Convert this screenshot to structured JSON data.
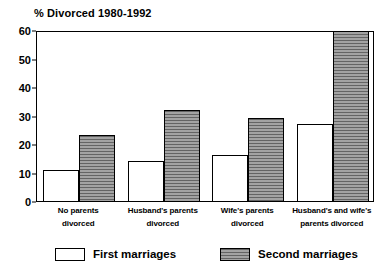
{
  "chart_data": {
    "type": "bar",
    "title": "% Divorced 1980-1992",
    "xlabel": "",
    "ylabel": "",
    "ylim": [
      0,
      60
    ],
    "yticks": [
      0,
      10,
      20,
      30,
      40,
      50,
      60
    ],
    "ytick_labels": [
      "0",
      "10",
      "20",
      "30",
      "40",
      "50",
      "60"
    ],
    "grid": false,
    "legend_position": "bottom",
    "categories": [
      "No parents divorced",
      "Husband's parents divorced",
      "Wife's parents divorced",
      "Husband's and wife's parents divorced"
    ],
    "category_lines": [
      [
        "No parents",
        "divorced"
      ],
      [
        "Husband's parents",
        "divorced"
      ],
      [
        "Wife's parents",
        "divorced"
      ],
      [
        "Husband's and wife's",
        "parents divorced"
      ]
    ],
    "series": [
      {
        "name": "First marriages",
        "values": [
          11,
          14,
          16,
          27
        ],
        "fill": "#ffffff",
        "pattern": "solid",
        "edge": "#000000"
      },
      {
        "name": "Second marriages",
        "values": [
          23,
          32,
          29,
          60
        ],
        "fill": "#8f8f8f",
        "pattern": "horizontal-hatch",
        "edge": "#000000"
      }
    ]
  },
  "colors": {
    "background": "#ffffff",
    "axis": "#000000",
    "text": "#000000",
    "series_first": "#ffffff",
    "series_second": "#8f8f8f"
  }
}
